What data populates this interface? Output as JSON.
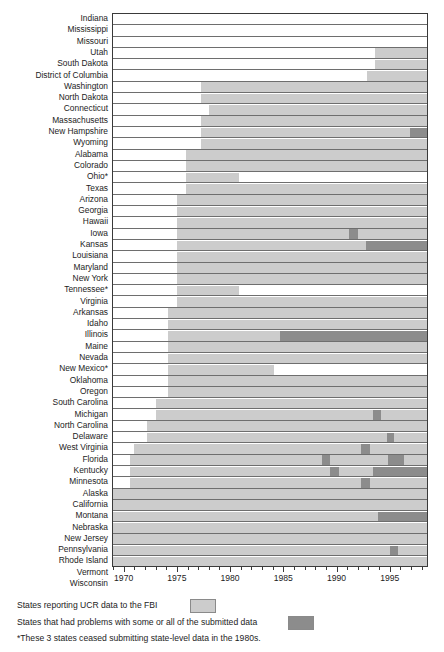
{
  "chart_data": {
    "type": "bar",
    "title": "",
    "xlabel": "",
    "ylabel": "",
    "xlim": [
      1969.0,
      1998.5
    ],
    "grid": false,
    "legend_position": "bottom",
    "tick_labels": [
      "1970",
      "1975",
      "1980",
      "1985",
      "1990",
      "1995"
    ],
    "tick_values": [
      1970,
      1975,
      1980,
      1985,
      1990,
      1995
    ],
    "minor_tick_step": 1,
    "series": [
      {
        "name": "States reporting UCR data to the FBI",
        "color": "#cccccc"
      },
      {
        "name": "States that had problems with some or all of the submitted data",
        "color": "#8c8c8c"
      }
    ],
    "categories": [
      "Indiana",
      "Mississippi",
      "Missouri",
      "Utah",
      "South Dakota",
      "District of Columbia",
      "Washington",
      "North Dakota",
      "Connecticut",
      "Massachusetts",
      "New Hampshire",
      "Wyoming",
      "Alabama",
      "Colorado",
      "Ohio*",
      "Texas",
      "Arizona",
      "Georgia",
      "Hawaii",
      "Iowa",
      "Kansas",
      "Louisiana",
      "Maryland",
      "New York",
      "Tennessee*",
      "Virginia",
      "Arkansas",
      "Idaho",
      "Illinois",
      "Maine",
      "Nevada",
      "New Mexico*",
      "Oklahoma",
      "Oregon",
      "South Carolina",
      "Michigan",
      "North Carolina",
      "Delaware",
      "West Virginia",
      "Florida",
      "Kentucky",
      "Minnesota",
      "Alaska",
      "California",
      "Montana",
      "Nebraska",
      "New Jersey",
      "Pennsylvania",
      "Rhode Island",
      "Vermont",
      "Wisconsin"
    ],
    "rows": [
      {
        "state": "Indiana",
        "spans": []
      },
      {
        "state": "Mississippi",
        "spans": []
      },
      {
        "state": "Missouri",
        "spans": []
      },
      {
        "state": "Utah",
        "spans": [
          {
            "start": 1993.6,
            "end": 1998.5,
            "kind": "light"
          }
        ]
      },
      {
        "state": "South Dakota",
        "spans": [
          {
            "start": 1993.6,
            "end": 1998.5,
            "kind": "light"
          }
        ]
      },
      {
        "state": "District of Columbia",
        "spans": [
          {
            "start": 1992.9,
            "end": 1998.5,
            "kind": "light"
          }
        ]
      },
      {
        "state": "Washington",
        "spans": [
          {
            "start": 1977.3,
            "end": 1998.5,
            "kind": "light"
          }
        ]
      },
      {
        "state": "North Dakota",
        "spans": [
          {
            "start": 1977.3,
            "end": 1998.5,
            "kind": "light"
          }
        ]
      },
      {
        "state": "Connecticut",
        "spans": [
          {
            "start": 1978.0,
            "end": 1998.5,
            "kind": "light"
          }
        ]
      },
      {
        "state": "Massachusetts",
        "spans": [
          {
            "start": 1977.3,
            "end": 1998.5,
            "kind": "light"
          }
        ]
      },
      {
        "state": "New Hampshire",
        "spans": [
          {
            "start": 1977.3,
            "end": 1996.9,
            "kind": "light"
          },
          {
            "start": 1996.9,
            "end": 1998.5,
            "kind": "dark"
          }
        ]
      },
      {
        "state": "Wyoming",
        "spans": [
          {
            "start": 1977.3,
            "end": 1998.5,
            "kind": "light"
          }
        ]
      },
      {
        "state": "Alabama",
        "spans": [
          {
            "start": 1975.9,
            "end": 1998.5,
            "kind": "light"
          }
        ]
      },
      {
        "state": "Colorado",
        "spans": [
          {
            "start": 1975.9,
            "end": 1998.5,
            "kind": "light"
          }
        ]
      },
      {
        "state": "Ohio*",
        "spans": [
          {
            "start": 1975.9,
            "end": 1980.8,
            "kind": "light"
          }
        ]
      },
      {
        "state": "Texas",
        "spans": [
          {
            "start": 1975.9,
            "end": 1998.5,
            "kind": "light"
          }
        ]
      },
      {
        "state": "Arizona",
        "spans": [
          {
            "start": 1975.0,
            "end": 1998.5,
            "kind": "light"
          }
        ]
      },
      {
        "state": "Georgia",
        "spans": [
          {
            "start": 1975.0,
            "end": 1998.5,
            "kind": "light"
          }
        ]
      },
      {
        "state": "Hawaii",
        "spans": [
          {
            "start": 1975.0,
            "end": 1998.5,
            "kind": "light"
          }
        ]
      },
      {
        "state": "Iowa",
        "spans": [
          {
            "start": 1975.0,
            "end": 1991.2,
            "kind": "light"
          },
          {
            "start": 1991.2,
            "end": 1992.0,
            "kind": "dark"
          },
          {
            "start": 1992.0,
            "end": 1998.5,
            "kind": "light"
          }
        ]
      },
      {
        "state": "Kansas",
        "spans": [
          {
            "start": 1975.0,
            "end": 1992.8,
            "kind": "light"
          },
          {
            "start": 1992.8,
            "end": 1998.5,
            "kind": "dark"
          }
        ]
      },
      {
        "state": "Louisiana",
        "spans": [
          {
            "start": 1975.0,
            "end": 1998.5,
            "kind": "light"
          }
        ]
      },
      {
        "state": "Maryland",
        "spans": [
          {
            "start": 1975.0,
            "end": 1998.5,
            "kind": "light"
          }
        ]
      },
      {
        "state": "New York",
        "spans": [
          {
            "start": 1975.0,
            "end": 1998.5,
            "kind": "light"
          }
        ]
      },
      {
        "state": "Tennessee*",
        "spans": [
          {
            "start": 1975.0,
            "end": 1980.8,
            "kind": "light"
          }
        ]
      },
      {
        "state": "Virginia",
        "spans": [
          {
            "start": 1975.0,
            "end": 1998.5,
            "kind": "light"
          }
        ]
      },
      {
        "state": "Arkansas",
        "spans": [
          {
            "start": 1974.2,
            "end": 1998.5,
            "kind": "light"
          }
        ]
      },
      {
        "state": "Idaho",
        "spans": [
          {
            "start": 1974.2,
            "end": 1998.5,
            "kind": "light"
          }
        ]
      },
      {
        "state": "Illinois",
        "spans": [
          {
            "start": 1974.2,
            "end": 1984.7,
            "kind": "light"
          },
          {
            "start": 1984.7,
            "end": 1998.5,
            "kind": "dark"
          }
        ]
      },
      {
        "state": "Maine",
        "spans": [
          {
            "start": 1974.2,
            "end": 1998.5,
            "kind": "light"
          }
        ]
      },
      {
        "state": "Nevada",
        "spans": [
          {
            "start": 1974.2,
            "end": 1998.5,
            "kind": "light"
          }
        ]
      },
      {
        "state": "New Mexico*",
        "spans": [
          {
            "start": 1974.2,
            "end": 1984.1,
            "kind": "light"
          }
        ]
      },
      {
        "state": "Oklahoma",
        "spans": [
          {
            "start": 1974.2,
            "end": 1998.5,
            "kind": "light"
          }
        ]
      },
      {
        "state": "Oregon",
        "spans": [
          {
            "start": 1974.2,
            "end": 1998.5,
            "kind": "light"
          }
        ]
      },
      {
        "state": "South Carolina",
        "spans": [
          {
            "start": 1973.0,
            "end": 1998.5,
            "kind": "light"
          }
        ]
      },
      {
        "state": "Michigan",
        "spans": [
          {
            "start": 1973.0,
            "end": 1993.4,
            "kind": "light"
          },
          {
            "start": 1993.4,
            "end": 1994.2,
            "kind": "dark"
          },
          {
            "start": 1994.2,
            "end": 1998.5,
            "kind": "light"
          }
        ]
      },
      {
        "state": "North Carolina",
        "spans": [
          {
            "start": 1972.2,
            "end": 1998.5,
            "kind": "light"
          }
        ]
      },
      {
        "state": "Delaware",
        "spans": [
          {
            "start": 1972.2,
            "end": 1994.7,
            "kind": "light"
          },
          {
            "start": 1994.7,
            "end": 1995.4,
            "kind": "dark"
          },
          {
            "start": 1995.4,
            "end": 1998.5,
            "kind": "light"
          }
        ]
      },
      {
        "state": "West Virginia",
        "spans": [
          {
            "start": 1971.0,
            "end": 1992.3,
            "kind": "light"
          },
          {
            "start": 1992.3,
            "end": 1993.1,
            "kind": "dark"
          },
          {
            "start": 1993.1,
            "end": 1998.5,
            "kind": "light"
          }
        ]
      },
      {
        "state": "Florida",
        "spans": [
          {
            "start": 1970.6,
            "end": 1988.6,
            "kind": "light"
          },
          {
            "start": 1988.6,
            "end": 1989.4,
            "kind": "dark"
          },
          {
            "start": 1989.4,
            "end": 1994.8,
            "kind": "light"
          },
          {
            "start": 1994.8,
            "end": 1996.3,
            "kind": "dark"
          },
          {
            "start": 1996.3,
            "end": 1998.5,
            "kind": "light"
          }
        ]
      },
      {
        "state": "Kentucky",
        "spans": [
          {
            "start": 1970.6,
            "end": 1989.4,
            "kind": "light"
          },
          {
            "start": 1989.4,
            "end": 1990.2,
            "kind": "dark"
          },
          {
            "start": 1990.2,
            "end": 1993.4,
            "kind": "light"
          },
          {
            "start": 1993.4,
            "end": 1998.5,
            "kind": "dark"
          }
        ]
      },
      {
        "state": "Minnesota",
        "spans": [
          {
            "start": 1970.6,
            "end": 1992.3,
            "kind": "light"
          },
          {
            "start": 1992.3,
            "end": 1993.1,
            "kind": "dark"
          },
          {
            "start": 1993.1,
            "end": 1998.5,
            "kind": "light"
          }
        ]
      },
      {
        "state": "Alaska",
        "spans": [
          {
            "start": 1969.0,
            "end": 1998.5,
            "kind": "light"
          }
        ]
      },
      {
        "state": "California",
        "spans": [
          {
            "start": 1969.0,
            "end": 1998.5,
            "kind": "light"
          }
        ]
      },
      {
        "state": "Montana",
        "spans": [
          {
            "start": 1969.0,
            "end": 1993.9,
            "kind": "light"
          },
          {
            "start": 1993.9,
            "end": 1998.5,
            "kind": "dark"
          }
        ]
      },
      {
        "state": "Nebraska",
        "spans": [
          {
            "start": 1969.0,
            "end": 1998.5,
            "kind": "light"
          }
        ]
      },
      {
        "state": "New Jersey",
        "spans": [
          {
            "start": 1969.0,
            "end": 1998.5,
            "kind": "light"
          }
        ]
      },
      {
        "state": "Pennsylvania",
        "spans": [
          {
            "start": 1969.0,
            "end": 1995.0,
            "kind": "light"
          },
          {
            "start": 1995.0,
            "end": 1995.8,
            "kind": "dark"
          },
          {
            "start": 1995.8,
            "end": 1998.5,
            "kind": "light"
          }
        ]
      },
      {
        "state": "Rhode Island",
        "spans": [
          {
            "start": 1969.0,
            "end": 1998.5,
            "kind": "light"
          }
        ]
      },
      {
        "state": "Vermont",
        "spans": [
          {
            "start": 1969.0,
            "end": 1997.3,
            "kind": "light"
          },
          {
            "start": 1997.3,
            "end": 1998.5,
            "kind": "dark"
          }
        ]
      },
      {
        "state": "Wisconsin",
        "spans": [
          {
            "start": 1969.0,
            "end": 1998.5,
            "kind": "light"
          }
        ]
      }
    ]
  },
  "legend": {
    "item_light": "States reporting UCR data to the FBI",
    "item_dark": "States that had problems with some or all of the submitted data",
    "footnote": "*These 3 states ceased submitting state-level data in the 1980s."
  }
}
